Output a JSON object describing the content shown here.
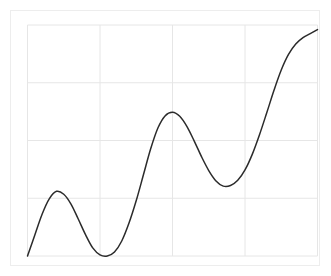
{
  "figure": {
    "background_color": "#ffffff",
    "frame_color": "#ededed"
  },
  "chart_data": {
    "type": "line",
    "title": "",
    "subtitle": "",
    "xlabel": "",
    "ylabel": "",
    "legend": [],
    "legend_position": "none",
    "grid": true,
    "grid_color": "#e6e6e6",
    "line_color": "#2b2b2b",
    "line_width": 1.5,
    "xlim": [
      0,
      4
    ],
    "ylim": [
      0,
      4
    ],
    "xticks": [
      0,
      1,
      2,
      3,
      4
    ],
    "yticks": [
      0,
      4
    ],
    "xtick_labels": [
      "",
      "",
      "",
      "",
      ""
    ],
    "ytick_labels": [
      "",
      "",
      "",
      "",
      ""
    ],
    "annotations": [],
    "series": [
      {
        "name": "curve",
        "x": [
          0.0,
          0.1,
          0.2,
          0.3,
          0.4,
          0.5,
          0.6,
          0.7,
          0.8,
          0.9,
          1.0,
          1.1,
          1.2,
          1.3,
          1.4,
          1.5,
          1.6,
          1.7,
          1.8,
          1.9,
          2.0,
          2.1,
          2.2,
          2.3,
          2.4,
          2.5,
          2.6,
          2.7,
          2.8,
          2.9,
          3.0,
          3.1,
          3.2,
          3.3,
          3.4,
          3.5,
          3.6,
          3.7,
          3.8,
          3.9,
          4.0
        ],
        "y": [
          0.0,
          0.36,
          0.72,
          0.99,
          1.12,
          1.07,
          0.9,
          0.64,
          0.37,
          0.14,
          0.02,
          0.0,
          0.07,
          0.26,
          0.57,
          0.96,
          1.41,
          1.86,
          2.22,
          2.43,
          2.49,
          2.42,
          2.24,
          1.99,
          1.72,
          1.48,
          1.3,
          1.21,
          1.22,
          1.31,
          1.49,
          1.76,
          2.1,
          2.48,
          2.87,
          3.22,
          3.49,
          3.67,
          3.78,
          3.85,
          3.92
        ]
      }
    ],
    "key_points": {
      "start": {
        "x": 0.0,
        "y": 0.0
      },
      "first_peak": {
        "x": 0.4,
        "y": 1.12
      },
      "first_trough": {
        "x": 1.1,
        "y": 0.0
      },
      "second_peak": {
        "x": 2.0,
        "y": 2.49
      },
      "second_trough": {
        "x": 2.7,
        "y": 1.21
      },
      "end": {
        "x": 4.0,
        "y": 3.92
      }
    }
  }
}
